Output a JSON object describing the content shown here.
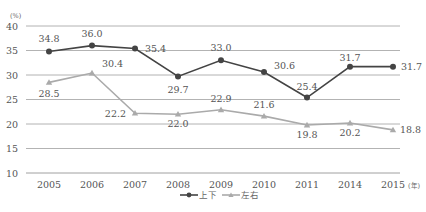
{
  "chart_data": {
    "type": "line",
    "title": "",
    "xlabel": "",
    "ylabel": "",
    "y_unit": "(%)",
    "x_unit": "(年)",
    "categories": [
      "2005",
      "2006",
      "2007",
      "2008",
      "2009",
      "2010",
      "2011",
      "2014",
      "2015"
    ],
    "ylim": [
      10,
      40
    ],
    "yticks": [
      10,
      15,
      20,
      25,
      30,
      35,
      40
    ],
    "grid": true,
    "legend_position": "bottom-center",
    "series": [
      {
        "name": "上下",
        "color": "#444444",
        "marker": "circle",
        "values": [
          34.8,
          36.0,
          35.4,
          29.7,
          33.0,
          30.6,
          25.4,
          31.7,
          31.7
        ],
        "labels": [
          "34.8",
          "36.0",
          "35.4",
          "29.7",
          "33.0",
          "30.6",
          "25.4",
          "31.7",
          "31.7"
        ]
      },
      {
        "name": "左右",
        "color": "#aaaaaa",
        "marker": "triangle",
        "values": [
          28.5,
          30.4,
          22.2,
          22.0,
          22.9,
          21.6,
          19.8,
          20.2,
          18.8
        ],
        "labels": [
          "28.5",
          "30.4",
          "22.2",
          "22.0",
          "22.9",
          "21.6",
          "19.8",
          "20.2",
          "18.8"
        ]
      }
    ]
  }
}
